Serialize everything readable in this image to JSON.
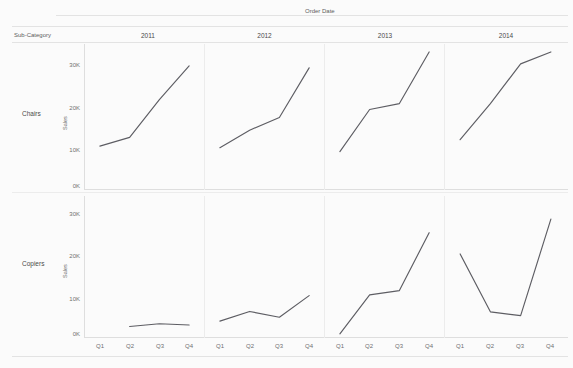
{
  "headers": {
    "column_field": "Order Date",
    "row_field": "Sub-Category",
    "columns": [
      "2011",
      "2012",
      "2013",
      "2014"
    ],
    "rows": [
      "Chairs",
      "Copiers"
    ]
  },
  "axis": {
    "y_title": "Sales",
    "y_ticks": [
      "30K",
      "20K",
      "10K",
      "0K"
    ],
    "x_ticks": [
      "Q1",
      "Q2",
      "Q3",
      "Q4"
    ]
  },
  "style": {
    "line_color": "#5d5d63",
    "grid_color": "#ececec",
    "text_color": "#4a4a4a",
    "background": "#fbfbfb"
  },
  "chart_data": {
    "type": "line",
    "title": "",
    "xlabel": "Order Date",
    "ylabel": "Sales",
    "ylim": [
      0,
      36000
    ],
    "grid": false,
    "legend": "none",
    "layout": "small-multiples 2 rows x 4 columns",
    "row_field": "Sub-Category",
    "column_field": "Order Date",
    "categories": [
      "Q1",
      "Q2",
      "Q3",
      "Q4"
    ],
    "y_tick_values": [
      0,
      10000,
      20000,
      30000
    ],
    "y_tick_labels": [
      "0K",
      "10K",
      "20K",
      "30K"
    ],
    "panels": [
      {
        "row": "Chairs",
        "column": "2011",
        "x": [
          "Q1",
          "Q2",
          "Q3",
          "Q4"
        ],
        "values": [
          10300,
          12500,
          22000,
          30500
        ]
      },
      {
        "row": "Chairs",
        "column": "2012",
        "x": [
          "Q1",
          "Q2",
          "Q3",
          "Q4"
        ],
        "values": [
          9900,
          14300,
          17500,
          30000
        ]
      },
      {
        "row": "Chairs",
        "column": "2013",
        "x": [
          "Q1",
          "Q2",
          "Q3",
          "Q4"
        ],
        "values": [
          8900,
          19500,
          21000,
          34000
        ]
      },
      {
        "row": "Chairs",
        "column": "2014",
        "x": [
          "Q1",
          "Q2",
          "Q3",
          "Q4"
        ],
        "values": [
          11900,
          21000,
          31000,
          34000
        ]
      },
      {
        "row": "Copiers",
        "column": "2011",
        "x": [
          "Q2",
          "Q3",
          "Q4"
        ],
        "values": [
          2200,
          2900,
          2600
        ]
      },
      {
        "row": "Copiers",
        "column": "2012",
        "x": [
          "Q1",
          "Q2",
          "Q3",
          "Q4"
        ],
        "values": [
          3600,
          6100,
          4600,
          10200
        ]
      },
      {
        "row": "Copiers",
        "column": "2013",
        "x": [
          "Q1",
          "Q2",
          "Q3",
          "Q4"
        ],
        "values": [
          300,
          10400,
          11500,
          26500
        ]
      },
      {
        "row": "Copiers",
        "column": "2014",
        "x": [
          "Q1",
          "Q2",
          "Q3",
          "Q4"
        ],
        "values": [
          21000,
          6000,
          5000,
          30000
        ]
      }
    ]
  }
}
